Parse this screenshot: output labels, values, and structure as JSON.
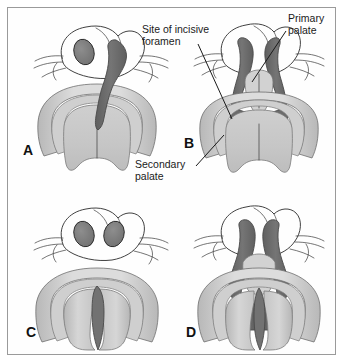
{
  "figure": {
    "border_color": "#9a9a9a",
    "background_color": "#ffffff"
  },
  "annotations": [
    {
      "id": "incisive-foramen",
      "line1": "Site of incisive",
      "line2": "foramen",
      "text_x": 142,
      "text_y": 33,
      "leader": "M 198 44 L 232 119"
    },
    {
      "id": "primary-palate",
      "line1": "Primary",
      "line2": "palate",
      "text_x": 288,
      "text_y": 22,
      "leader": "M 286 31 L 252 82"
    },
    {
      "id": "secondary-palate",
      "line1": "Secondary",
      "line2": "palate",
      "text_x": 135,
      "text_y": 168,
      "leader": "M 196 166 L 224 135"
    }
  ],
  "panels": [
    {
      "id": "A",
      "letter": "A",
      "letter_x": 23,
      "letter_y": 155,
      "caption": "Unilateral cleft lip extending into the primary palate",
      "cleft_type": "unilateral-cleft-lip-and-primary-palate",
      "nostrils_dark": 1,
      "cleft_sides": "left"
    },
    {
      "id": "B",
      "letter": "B",
      "letter_x": 184,
      "letter_y": 148,
      "caption": "Bilateral cleft lip with isolated primary palate segment",
      "cleft_type": "bilateral-cleft-lip-and-primary-palate",
      "nostrils_dark": 2,
      "cleft_sides": "both"
    },
    {
      "id": "C",
      "letter": "C",
      "letter_x": 26,
      "letter_y": 337,
      "caption": "Isolated midline cleft of the secondary palate",
      "cleft_type": "isolated-cleft-secondary-palate",
      "nostrils_dark": 2,
      "cleft_sides": "midline"
    },
    {
      "id": "D",
      "letter": "D",
      "letter_x": 186,
      "letter_y": 337,
      "caption": "Complete bilateral cleft of primary and secondary palate",
      "cleft_type": "complete-bilateral-cleft-lip-and-palate",
      "nostrils_dark": 2,
      "cleft_sides": "both-complete"
    }
  ],
  "palette": {
    "cleft_dark": "#6e6e6e",
    "cleft_darker": "#5c5c5c",
    "palate_light": "#d9d9d9",
    "palate_mid": "#c2c2c2",
    "palate_shade": "#b0b0b0",
    "nostril": "#808080",
    "outline": "#2b2b2b",
    "face_fill": "#ffffff"
  }
}
